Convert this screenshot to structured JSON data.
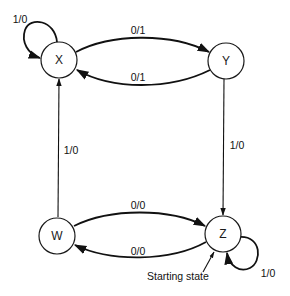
{
  "diagram": {
    "type": "state-machine",
    "title": "",
    "nodes": [
      {
        "id": "X",
        "label": "X"
      },
      {
        "id": "Y",
        "label": "Y"
      },
      {
        "id": "W",
        "label": "W"
      },
      {
        "id": "Z",
        "label": "Z"
      }
    ],
    "edges": [
      {
        "from": "X",
        "to": "X",
        "label": "1/0"
      },
      {
        "from": "X",
        "to": "Y",
        "label": "0/1"
      },
      {
        "from": "Y",
        "to": "X",
        "label": "0/1"
      },
      {
        "from": "Y",
        "to": "Z",
        "label": "1/0"
      },
      {
        "from": "W",
        "to": "X",
        "label": "1/0"
      },
      {
        "from": "W",
        "to": "Z",
        "label": "0/0"
      },
      {
        "from": "Z",
        "to": "W",
        "label": "0/0"
      },
      {
        "from": "Z",
        "to": "Z",
        "label": "1/0"
      }
    ],
    "annotations": {
      "starting_state": "Starting state"
    }
  }
}
